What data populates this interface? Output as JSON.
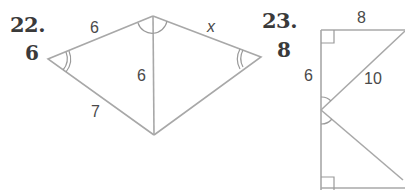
{
  "problems": [
    {
      "number": "22.",
      "answer": "6",
      "figure": {
        "labels": {
          "top_left_side": "6",
          "diagonal": "6",
          "bottom_left_side": "7",
          "top_right_side": "x"
        }
      }
    },
    {
      "number": "23.",
      "answer": "8",
      "figure": {
        "labels": {
          "top_side": "8",
          "left_side": "6",
          "hypotenuse": "10"
        }
      }
    }
  ]
}
